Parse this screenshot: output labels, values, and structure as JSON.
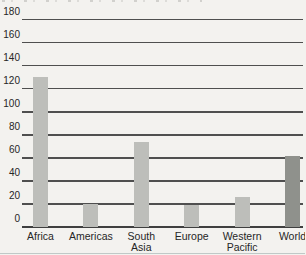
{
  "page": {
    "background": "#f3f2ef"
  },
  "chart_data": {
    "type": "bar",
    "title": "",
    "categories": [
      "Africa",
      "Americas",
      "South\nAsia",
      "Europe",
      "Western\nPacific",
      "World"
    ],
    "values": [
      130,
      20,
      74,
      19,
      26,
      62
    ],
    "ylim": [
      0,
      180
    ],
    "ytick_step": 20,
    "ytick_labels": [
      "0",
      "20",
      "40",
      "60",
      "80",
      "100",
      "120",
      "140",
      "160",
      "180"
    ],
    "grid": true,
    "legend": false,
    "xlabel": "",
    "ylabel": "",
    "bar_color": "#bdbeba",
    "highlight_color": "#8f918c",
    "highlight_index": 5,
    "gridline_color": "#4f4f4f",
    "axis_color": "#3f3f3f",
    "label_color": "#262626"
  }
}
